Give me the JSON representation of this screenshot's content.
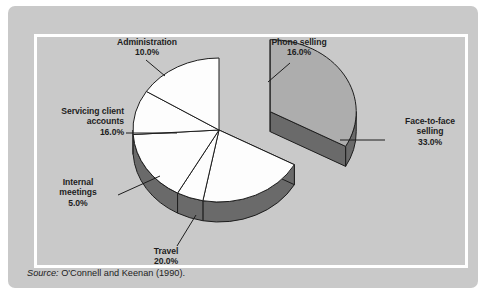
{
  "figure": {
    "source_prefix": "Source:",
    "source_text": " O'Connell and Keenan (1990).",
    "background_color": "#c9c9c9",
    "frame_color": "#ffffff"
  },
  "chart_data": {
    "type": "pie",
    "title": "",
    "exploded_slice": "Face-to-face selling",
    "three_d": true,
    "legend": "none",
    "labels_show_percent": true,
    "categories": [
      "Face-to-face selling",
      "Travel",
      "Internal meetings",
      "Servicing client accounts",
      "Administration",
      "Phone selling"
    ],
    "values": [
      33.0,
      20.0,
      5.0,
      16.0,
      10.0,
      16.0
    ],
    "slices": [
      {
        "name": "Face-to-face selling",
        "label_line1": "Face-to-face",
        "label_line2": "selling",
        "value": 33.0,
        "value_label": "33.0%",
        "fill": "#adadad",
        "side": "#6a6a6a",
        "exploded": true
      },
      {
        "name": "Travel",
        "label_line1": "Travel",
        "label_line2": "",
        "value": 20.0,
        "value_label": "20.0%",
        "fill": "#fdfdfd",
        "side": "#6a6a6a",
        "exploded": false
      },
      {
        "name": "Internal meetings",
        "label_line1": "Internal",
        "label_line2": "meetings",
        "value": 5.0,
        "value_label": "5.0%",
        "fill": "#fdfdfd",
        "side": "#6a6a6a",
        "exploded": false
      },
      {
        "name": "Servicing client accounts",
        "label_line1": "Servicing client",
        "label_line2": "accounts",
        "value": 16.0,
        "value_label": "16.0%",
        "fill": "#fdfdfd",
        "side": "#6a6a6a",
        "exploded": false
      },
      {
        "name": "Administration",
        "label_line1": "Administration",
        "label_line2": "",
        "value": 10.0,
        "value_label": "10.0%",
        "fill": "#fdfdfd",
        "side": "#6a6a6a",
        "exploded": false
      },
      {
        "name": "Phone selling",
        "label_line1": "Phone selling",
        "label_line2": "",
        "value": 16.0,
        "value_label": "16.0%",
        "fill": "#fdfdfd",
        "side": "#6a6a6a",
        "exploded": false
      }
    ]
  }
}
